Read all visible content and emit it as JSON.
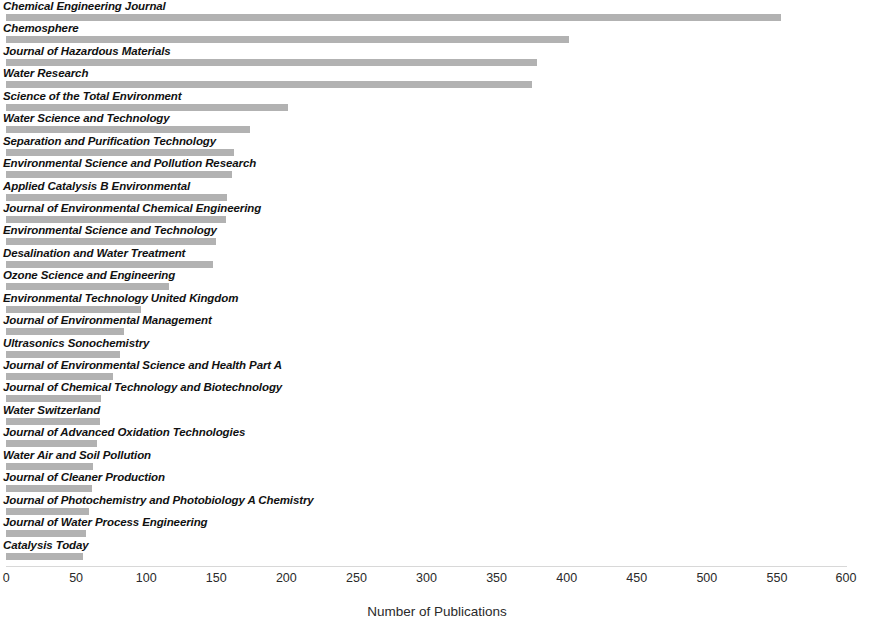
{
  "chart_data": {
    "type": "bar",
    "orientation": "horizontal",
    "title": "",
    "xlabel": "Number of Publications",
    "ylabel": "",
    "xlim": [
      0,
      600
    ],
    "xticks": [
      0,
      50,
      100,
      150,
      200,
      250,
      300,
      350,
      400,
      450,
      500,
      550,
      600
    ],
    "grid": false,
    "legend": null,
    "bar_color": "#b2b2b2",
    "categories": [
      "Chemical Engineering Journal",
      "Chemosphere",
      "Journal of Hazardous Materials",
      "Water Research",
      "Science of the Total Environment",
      "Water Science and Technology",
      "Separation and Purification Technology",
      "Environmental Science and Pollution Research",
      "Applied Catalysis B Environmental",
      "Journal of Environmental Chemical Engineering",
      "Environmental Science and Technology",
      "Desalination and Water Treatment",
      "Ozone Science and Engineering",
      "Environmental Technology United Kingdom",
      "Journal of Environmental Management",
      "Ultrasonics Sonochemistry",
      "Journal of Environmental Science and Health Part A",
      "Journal of Chemical Technology and Biotechnology",
      "Water Switzerland",
      "Journal of Advanced Oxidation Technologies",
      "Water Air and Soil Pollution",
      "Journal of Cleaner Production",
      "Journal of Photochemistry and Photobiology A Chemistry",
      "Journal of Water Process Engineering",
      "Catalysis Today"
    ],
    "values": [
      553,
      402,
      379,
      375,
      201,
      174,
      163,
      161,
      158,
      157,
      150,
      148,
      116,
      96,
      84,
      81,
      76,
      68,
      67,
      65,
      62,
      61,
      59,
      57,
      55
    ]
  }
}
